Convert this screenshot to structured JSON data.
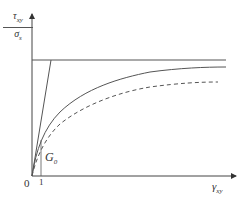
{
  "diagram": {
    "y_label": {
      "num": "τ",
      "num_sub": "xy",
      "den": "σ",
      "den_sub": "s"
    },
    "x_label": {
      "text": "γ",
      "sub": "xy"
    },
    "origin_label": "0",
    "tick_label": "1",
    "slope_label": {
      "text": "G",
      "sub": "0"
    },
    "curves": [
      {
        "name": "asymptote",
        "style": "solid",
        "y_level": 1.0
      },
      {
        "name": "initial-tangent",
        "style": "solid"
      },
      {
        "name": "upper-curve",
        "style": "solid"
      },
      {
        "name": "lower-curve",
        "style": "dashed"
      }
    ],
    "colors": {
      "line": "#555555",
      "text": "#333333"
    }
  }
}
